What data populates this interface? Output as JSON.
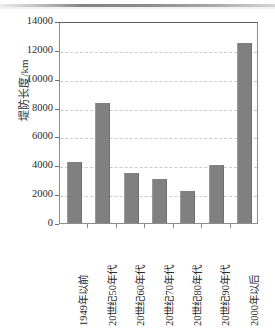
{
  "chart_data": {
    "type": "bar",
    "title": "",
    "xlabel": "",
    "ylabel": "堤防长度/km",
    "categories": [
      "1949年以前",
      "20世纪50年代",
      "20世纪60年代",
      "20世纪70年代",
      "20世纪80年代",
      "20世纪90年代",
      "2000年以后"
    ],
    "values": [
      4250,
      8300,
      3450,
      3050,
      2200,
      4050,
      12500
    ],
    "ylim": [
      0,
      14000
    ],
    "yticks": [
      0,
      2000,
      4000,
      6000,
      8000,
      10000,
      12000,
      14000
    ],
    "ytick_labels": [
      "0",
      "2000",
      "4000",
      "6000",
      "8000",
      "10000",
      "12000",
      "14000"
    ],
    "grid": true,
    "grid_axis": "y",
    "grid_style": "dashed",
    "legend": false,
    "series_color": "#808080",
    "frame_color": "#8d8d8d",
    "grid_color": "#cccccc"
  }
}
